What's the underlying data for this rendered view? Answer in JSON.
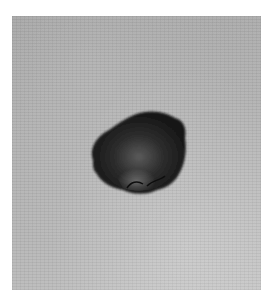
{
  "image": {
    "subject": "dark raised skin lesion",
    "background_color": "#b2b2b2",
    "lesion_color": "#1f1f1f",
    "border_color": "#ffffff"
  }
}
